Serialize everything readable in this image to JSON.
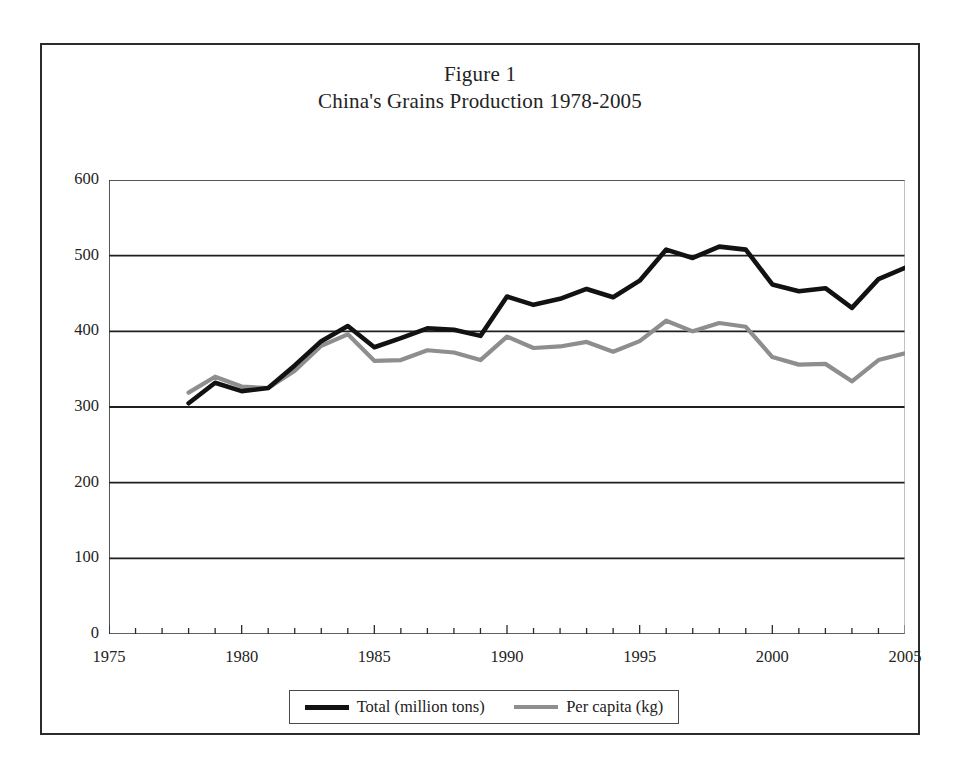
{
  "figure": {
    "title_line1": "Figure 1",
    "title_line2": "China's Grains Production 1978-2005"
  },
  "legend": {
    "total_label": "Total (million tons)",
    "percapita_label": "Per capita (kg)"
  },
  "colors": {
    "total_line": "#121212",
    "percapita_line": "#8e8e8e",
    "axis": "#2b2b2b",
    "gridline": "#1f1f1f",
    "page_border": "#2b2b2b"
  },
  "chart_data": {
    "type": "line",
    "title": "China's Grains Production 1978-2005",
    "xlabel": "",
    "ylabel": "",
    "xlim": [
      1975,
      2005
    ],
    "ylim": [
      0,
      600
    ],
    "ytick_labels": [
      "0",
      "100",
      "200",
      "300",
      "400",
      "500",
      "600"
    ],
    "yticks": [
      0,
      100,
      200,
      300,
      400,
      500,
      600
    ],
    "xtick_labels": [
      "1975",
      "1980",
      "1985",
      "1990",
      "1995",
      "2000",
      "2005"
    ],
    "xticks": [
      1975,
      1980,
      1985,
      1990,
      1995,
      2000,
      2005
    ],
    "minor_xtick_interval": 1,
    "grid": "horizontal",
    "legend_position": "bottom",
    "x": [
      1978,
      1979,
      1980,
      1981,
      1982,
      1983,
      1984,
      1985,
      1986,
      1987,
      1988,
      1989,
      1990,
      1991,
      1992,
      1993,
      1994,
      1995,
      1996,
      1997,
      1998,
      1999,
      2000,
      2001,
      2002,
      2003,
      2004,
      2005
    ],
    "series": [
      {
        "name": "Total (million tons)",
        "color": "#121212",
        "values": [
          305,
          332,
          321,
          325,
          355,
          387,
          407,
          379,
          391,
          404,
          402,
          394,
          446,
          435,
          443,
          456,
          445,
          467,
          508,
          497,
          512,
          508,
          462,
          453,
          457,
          431,
          469,
          484
        ]
      },
      {
        "name": "Per capita (kg)",
        "color": "#8e8e8e",
        "values": [
          319,
          340,
          327,
          325,
          348,
          381,
          396,
          361,
          362,
          375,
          372,
          362,
          393,
          378,
          380,
          386,
          373,
          387,
          414,
          400,
          411,
          406,
          366,
          356,
          357,
          334,
          362,
          371
        ]
      }
    ]
  }
}
